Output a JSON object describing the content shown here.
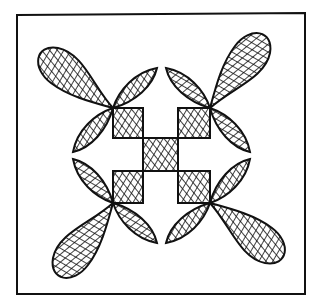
{
  "illustration": {
    "subject": "quilt block drawing",
    "style": "pen-and-ink crosshatch",
    "colors": {
      "ink": "#111111",
      "paper": "#ffffff"
    },
    "frame": {
      "x": 17,
      "y": 14,
      "width": 288,
      "height": 280
    },
    "motifs": [
      {
        "name": "top-left-flower",
        "center": [
          113,
          108
        ],
        "orientation": 0
      },
      {
        "name": "top-right-flower",
        "center": [
          210,
          108
        ],
        "orientation": 90
      },
      {
        "name": "bottom-right-flower",
        "center": [
          210,
          203
        ],
        "orientation": 180
      },
      {
        "name": "bottom-left-flower",
        "center": [
          113,
          203
        ],
        "orientation": 270
      }
    ],
    "squares": [
      {
        "name": "square-top-left",
        "x": 113,
        "y": 108,
        "w": 30,
        "h": 30
      },
      {
        "name": "square-top-right",
        "x": 178,
        "y": 108,
        "w": 32,
        "h": 30
      },
      {
        "name": "square-center",
        "x": 143,
        "y": 138,
        "w": 35,
        "h": 33
      },
      {
        "name": "square-bottom-left",
        "x": 113,
        "y": 171,
        "w": 30,
        "h": 32
      },
      {
        "name": "square-bottom-right",
        "x": 178,
        "y": 171,
        "w": 32,
        "h": 32
      }
    ]
  }
}
